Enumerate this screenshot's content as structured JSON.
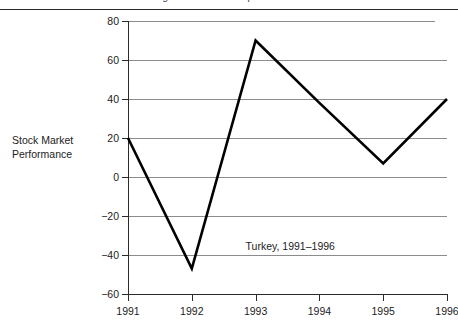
{
  "figure": {
    "top_caption_fragment": "Figure: stock market performance",
    "axis_title": "Stock Market\nPerformance",
    "annotation": "Turkey, 1991–1996"
  },
  "chart_data": {
    "type": "line",
    "title": "",
    "subtitle": "",
    "annotation": "Turkey, 1991–1996",
    "xlabel": "",
    "ylabel": "Stock Market Performance",
    "categories": [
      "1991",
      "1992",
      "1993",
      "1994",
      "1995",
      "1996"
    ],
    "x": [
      1991,
      1992,
      1993,
      1994,
      1995,
      1996
    ],
    "values": [
      20,
      -47,
      70,
      38,
      7,
      40
    ],
    "series": [
      {
        "name": "Turkey",
        "values": [
          20,
          -47,
          70,
          38,
          7,
          40
        ]
      }
    ],
    "ylim": [
      -60,
      80
    ],
    "yticks": [
      80,
      60,
      40,
      20,
      0,
      -20,
      -40,
      -60
    ],
    "ytick_labels": [
      "80",
      "60",
      "40",
      "20",
      "0",
      "−20",
      "−40",
      "−60"
    ],
    "xlim": [
      1991,
      1996
    ],
    "xticks": [
      1991,
      1992,
      1993,
      1994,
      1995,
      1996
    ],
    "xtick_labels": [
      "1991",
      "1992",
      "1993",
      "1994",
      "1995",
      "1996"
    ],
    "grid": "horizontal",
    "legend": "none",
    "line_color": "#000000",
    "grid_color": "#8c8c8c",
    "axis_color": "#2b2b2b",
    "background_color": "#ffffff"
  }
}
